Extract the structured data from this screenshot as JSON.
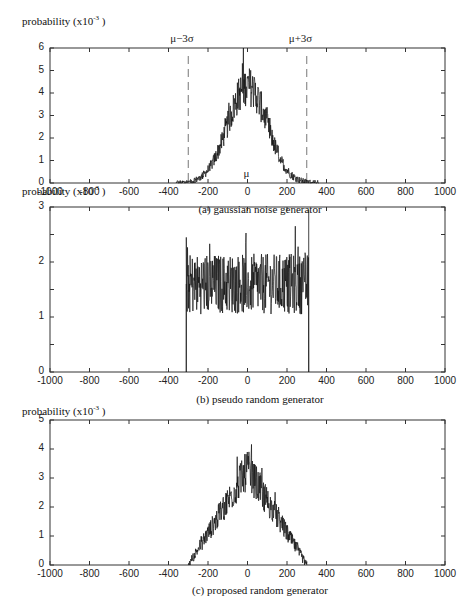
{
  "chart_data": [
    {
      "type": "line",
      "id": "a",
      "caption": "(a) gaussian noise generator",
      "ylabel": "probability (x10",
      "ylabel_exp": "-3",
      "ylabel_close": ")",
      "xlim": [
        -1000,
        1000
      ],
      "ylim": [
        0,
        6
      ],
      "xticks": [
        -1000,
        -800,
        -600,
        -400,
        -200,
        0,
        200,
        400,
        600,
        800,
        1000
      ],
      "yticks": [
        0,
        1,
        2,
        3,
        4,
        5,
        6
      ],
      "annotations": [
        {
          "text": "μ−3σ",
          "x": -300,
          "kind": "dashed-vline"
        },
        {
          "text": "μ+3σ",
          "x": 300,
          "kind": "dashed-vline"
        },
        {
          "text": "μ",
          "x": 0,
          "kind": "label"
        }
      ],
      "shape": "gaussian",
      "peak": 4.3,
      "peak_max_spike": 5.4,
      "support": [
        -360,
        360
      ],
      "sigma": 100
    },
    {
      "type": "line",
      "id": "b",
      "caption": "(b) pseudo random generator",
      "ylabel": "probability (x10",
      "ylabel_exp": "-3",
      "ylabel_close": ")",
      "xlim": [
        -1000,
        1000
      ],
      "ylim": [
        0,
        3
      ],
      "xticks": [
        -1000,
        -800,
        -600,
        -400,
        -200,
        0,
        200,
        400,
        600,
        800,
        1000
      ],
      "yticks": [
        0,
        1,
        2,
        3
      ],
      "yticks_minor": [
        0.5,
        1.5,
        2.5
      ],
      "shape": "uniform",
      "level": 1.6,
      "level_min": 0.8,
      "level_max": 2.9,
      "support": [
        -310,
        310
      ]
    },
    {
      "type": "line",
      "id": "c",
      "caption": "(c) proposed random generator",
      "ylabel": "probability (x10",
      "ylabel_exp": "-3",
      "ylabel_close": ")",
      "xlim": [
        -1000,
        1000
      ],
      "ylim": [
        0,
        5
      ],
      "xticks": [
        -1000,
        -800,
        -600,
        -400,
        -200,
        0,
        200,
        400,
        600,
        800,
        1000
      ],
      "yticks": [
        0,
        1,
        2,
        3,
        4,
        5
      ],
      "shape": "triangular",
      "peak": 3.3,
      "peak_max_spike": 4.5,
      "support": [
        -300,
        300
      ]
    }
  ]
}
